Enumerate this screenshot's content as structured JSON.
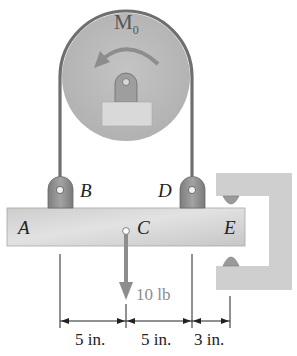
{
  "diagram": {
    "type": "pulley-beam statics problem",
    "pulley": {
      "moment_label": "M",
      "moment_subscript": "0",
      "moment_direction": "counterclockwise"
    },
    "points": {
      "A": "A",
      "B": "B",
      "C": "C",
      "D": "D",
      "E": "E"
    },
    "load": {
      "label": "10 lb",
      "direction": "down",
      "at": "C"
    },
    "dimensions": [
      {
        "from": "B",
        "to": "C",
        "label": "5 in."
      },
      {
        "from": "C",
        "to": "D",
        "label": "5 in."
      },
      {
        "from": "D",
        "to": "E",
        "label": "3 in."
      }
    ],
    "colors": {
      "pulley": "#b9b9b9",
      "cable": "#6f6f6f",
      "beam": "#d2d2d2",
      "support": "#cfcfcf",
      "bracket": "#8c8c8c",
      "load_arrow": "#8d8d8d",
      "load_text": "#8d8d8d",
      "ink": "#222222"
    }
  }
}
